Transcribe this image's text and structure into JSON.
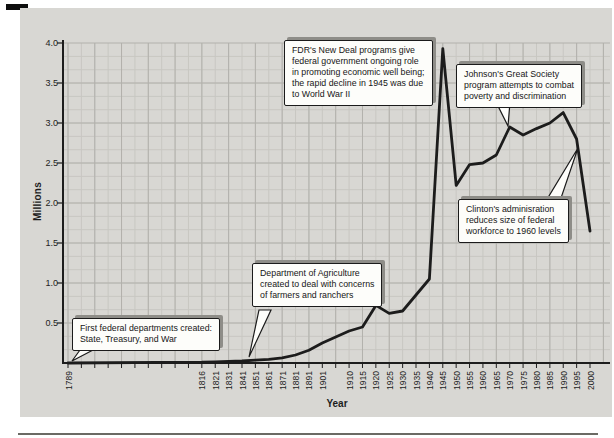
{
  "figure": {
    "y_axis_title": "Millions",
    "x_axis_title": "Year"
  },
  "colors": {
    "panel": "#d8d7d3",
    "fine_grid": "#c8c7c2",
    "major_grid": "#b2b1ac",
    "line": "#1c1c1c",
    "axis": "#1d1d1d",
    "callout_background": "#fdfdfa",
    "callout_shadow": "#8e8d88"
  },
  "chart_data": {
    "type": "line",
    "title": "",
    "xlabel": "Year",
    "ylabel": "Millions",
    "ylim": [
      0,
      4.0
    ],
    "grid": "on",
    "y_tick_labels": [
      "4.0",
      "3.5",
      "3.0",
      "2.5",
      "2.0",
      "1.5",
      "1.0",
      "0.5"
    ],
    "x_tick_labels": [
      "1789",
      "",
      "",
      "",
      "",
      "",
      "",
      "",
      "",
      "",
      "1816",
      "1821",
      "1831",
      "1841",
      "1851",
      "1861",
      "1871",
      "1881",
      "1891",
      "1901",
      "",
      "1910",
      "1915",
      "1920",
      "1925",
      "1930",
      "1935",
      "1940",
      "1945",
      "1950",
      "1955",
      "1960",
      "1965",
      "1970",
      "1975",
      "1980",
      "1985",
      "1990",
      "1995",
      "2000"
    ],
    "series": [
      {
        "name": "Federal employees (millions)",
        "points": [
          [
            1789,
            0.0
          ],
          [
            1816,
            0.01
          ],
          [
            1821,
            0.015
          ],
          [
            1831,
            0.02
          ],
          [
            1841,
            0.025
          ],
          [
            1851,
            0.035
          ],
          [
            1861,
            0.045
          ],
          [
            1871,
            0.065
          ],
          [
            1881,
            0.1
          ],
          [
            1891,
            0.16
          ],
          [
            1901,
            0.25
          ],
          [
            1910,
            0.4
          ],
          [
            1915,
            0.45
          ],
          [
            1920,
            0.72
          ],
          [
            1925,
            0.62
          ],
          [
            1930,
            0.65
          ],
          [
            1935,
            0.85
          ],
          [
            1940,
            1.05
          ],
          [
            1945,
            3.93
          ],
          [
            1950,
            2.22
          ],
          [
            1955,
            2.48
          ],
          [
            1960,
            2.5
          ],
          [
            1965,
            2.6
          ],
          [
            1970,
            2.95
          ],
          [
            1975,
            2.85
          ],
          [
            1980,
            2.93
          ],
          [
            1985,
            3.0
          ],
          [
            1990,
            3.13
          ],
          [
            1995,
            2.8
          ],
          [
            2000,
            1.65
          ]
        ]
      }
    ],
    "annotations": [
      {
        "id": "first-departments",
        "text": "First federal departments created:\nState, Treasury, and War"
      },
      {
        "id": "agriculture",
        "text": "Department of Agriculture\ncreated to deal with concerns\nof farmers and ranchers"
      },
      {
        "id": "fdr-new-deal",
        "text": "FDR's New Deal programs give\nfederal government ongoing role\nin promoting economic well being;\nthe rapid decline in 1945 was due\nto World War II"
      },
      {
        "id": "johnson-great-society",
        "text": "Johnson's Great Society\nprogram attempts to combat\npoverty and discrimination"
      },
      {
        "id": "clinton",
        "text": "Clinton's adminisration\nreduces size of federal\nworkforce to 1960 levels"
      }
    ]
  }
}
